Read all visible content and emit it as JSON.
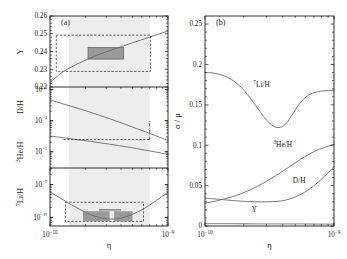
{
  "figure": {
    "caption_tags": {
      "left": "(a)",
      "right": "(b)"
    }
  },
  "panel_a": {
    "tag": "(a)",
    "xlabel": "η",
    "xticklabels": [
      "10⁻¹⁰",
      "10⁻⁹"
    ],
    "xlim": [
      1e-10,
      1e-09
    ],
    "shaded_band": [
      1.45e-10,
      7e-10
    ],
    "subpanels": [
      {
        "name": "Y",
        "ylabel": "Y",
        "ylim": [
          0.22,
          0.26
        ],
        "yticklabels": [
          "0.22",
          "0.23",
          "0.24",
          "0.25",
          "0.26"
        ],
        "ytickvalues": [
          0.22,
          0.23,
          0.24,
          0.25,
          0.26
        ],
        "curve": {
          "x": [
            1e-10,
            1.3e-10,
            1.8e-10,
            2.5e-10,
            3.5e-10,
            5e-10,
            7e-10,
            1e-09
          ],
          "y": [
            0.2225,
            0.2287,
            0.2337,
            0.2379,
            0.2414,
            0.2449,
            0.2481,
            0.2516
          ]
        },
        "dashed_box": {
          "x0": 1.13e-10,
          "x1": 7.1e-10,
          "y0": 0.2288,
          "y1": 0.2492
        },
        "filled_box": {
          "x0": 2.1e-10,
          "x1": 4.2e-10,
          "y0": 0.2357,
          "y1": 0.2422
        }
      },
      {
        "name": "D/H and 3He/H",
        "ylabel_upper": "D/H",
        "ylabel_lower": "³He/H",
        "ylim": [
          3e-06,
          0.0012
        ],
        "yticklabels": [
          "10⁻³",
          "10⁻⁴",
          "10⁻⁵"
        ],
        "ytickvalues": [
          0.001,
          0.0001,
          1e-05
        ],
        "curve_DH": {
          "x": [
            1e-10,
            1.5e-10,
            2.2e-10,
            3.2e-10,
            4.5e-10,
            6.5e-10,
            1e-09
          ],
          "y": [
            0.00046,
            0.00029,
            0.000185,
            0.000115,
            7.2e-05,
            4.3e-05,
            2.3e-05
          ]
        },
        "curve_He3H": {
          "x": [
            1e-10,
            1.5e-10,
            2.2e-10,
            3.2e-10,
            4.5e-10,
            6.5e-10,
            1e-09
          ],
          "y": [
            3.2e-05,
            2.6e-05,
            2.15e-05,
            1.75e-05,
            1.42e-05,
            1.12e-05,
            8.2e-06
          ]
        },
        "dashed_line_y": 2.45e-05,
        "dashed_line_x": [
          1.3e-10,
          7e-10
        ],
        "dashdot_vline_x": 7e-10,
        "dashdot_vline_y": [
          2.45e-05,
          9.5e-05
        ]
      },
      {
        "name": "7Li/H",
        "ylabel": "⁷Li/H",
        "ylim": [
          5.5e-11,
          3.2e-09
        ],
        "yticklabels": [
          "10⁻⁹",
          "10⁻¹⁰"
        ],
        "ytickvalues": [
          1e-09,
          1e-10
        ],
        "curve": {
          "x": [
            1e-10,
            1.3e-10,
            1.7e-10,
            2.2e-10,
            2.9e-10,
            3.6e-10,
            4.4e-10,
            5.5e-10,
            7e-10,
            1e-09
          ],
          "y": [
            6e-10,
            3.4e-10,
            1.95e-10,
            1.22e-10,
            9.3e-11,
            9.1e-11,
            1.05e-10,
            1.45e-10,
            2.4e-10,
            5.8e-10
          ]
        },
        "dashed_box": {
          "x0": 1.35e-10,
          "x1": 6.2e-10,
          "y0": 7.6e-11,
          "y1": 2.9e-10
        },
        "filled_left": {
          "x0": 1.9e-10,
          "x1": 3.2e-10,
          "y0": 7.6e-11,
          "y1": 1.55e-10
        },
        "filled_right": {
          "x0": 3.5e-10,
          "x1": 5e-10,
          "y0": 7.6e-11,
          "y1": 1.55e-10
        }
      }
    ]
  },
  "panel_b": {
    "tag": "(b)",
    "xlabel": "η",
    "ylabel": "σ / μ",
    "xticklabels": [
      "10⁻¹⁰",
      "10⁻⁹"
    ],
    "xlim": [
      1e-10,
      1e-09
    ],
    "ylim": [
      0,
      0.26
    ],
    "yticklabels": [
      "0",
      "0.05",
      "0.1",
      "0.15",
      "0.2",
      "0.25"
    ],
    "ytickvalues": [
      0,
      0.05,
      0.1,
      0.15,
      0.2,
      0.25
    ],
    "series": [
      {
        "label": "⁷Li/H",
        "label_x": 2.3e-10,
        "label_y": 0.172,
        "x": [
          1e-10,
          1.2e-10,
          1.5e-10,
          1.9e-10,
          2.4e-10,
          3e-10,
          3.6e-10,
          4.2e-10,
          4.8e-10,
          5.5e-10,
          6.5e-10,
          8e-10,
          1e-09
        ],
        "y": [
          0.19,
          0.189,
          0.184,
          0.172,
          0.152,
          0.131,
          0.122,
          0.126,
          0.139,
          0.153,
          0.163,
          0.167,
          0.168
        ]
      },
      {
        "label": "³He/H",
        "label_x": 3.6e-10,
        "label_y": 0.098,
        "x": [
          1e-10,
          1.3e-10,
          1.8e-10,
          2.4e-10,
          3.2e-10,
          4.2e-10,
          5.5e-10,
          7e-10,
          8.5e-10,
          1e-09
        ],
        "y": [
          0.0282,
          0.032,
          0.0385,
          0.047,
          0.058,
          0.07,
          0.0825,
          0.092,
          0.0975,
          0.101
        ]
      },
      {
        "label": "D/H",
        "label_x": 5e-10,
        "label_y": 0.0535,
        "x": [
          1e-10,
          1.3e-10,
          1.8e-10,
          2.4e-10,
          3.2e-10,
          4.2e-10,
          5.5e-10,
          7e-10,
          8.5e-10,
          1e-09
        ],
        "y": [
          0.0345,
          0.033,
          0.031,
          0.03,
          0.03,
          0.032,
          0.039,
          0.05,
          0.062,
          0.0735
        ]
      },
      {
        "label": "Y",
        "label_x": 2.4e-10,
        "label_y": 0.0175,
        "x": [
          1e-10,
          2e-10,
          4e-10,
          6e-10,
          8e-10,
          1e-09
        ],
        "y": [
          0.003,
          0.0028,
          0.0026,
          0.0025,
          0.0024,
          0.0023
        ]
      }
    ]
  },
  "chart_data": {
    "type": "line",
    "title": "",
    "xlabel": "η",
    "panels": [
      {
        "id": "a",
        "description": "Primordial abundances vs baryon-to-photon ratio",
        "subplots": [
          {
            "ylabel": "Y",
            "ylim": [
              0.22,
              0.26
            ],
            "yscale": "linear",
            "yticks": [
              0.22,
              0.23,
              0.24,
              0.25,
              0.26
            ],
            "series": [
              {
                "name": "Y",
                "x": [
                  1e-10,
                  1.3e-10,
                  1.8e-10,
                  2.5e-10,
                  3.5e-10,
                  5e-10,
                  7e-10,
                  1e-09
                ],
                "y": [
                  0.2225,
                  0.2287,
                  0.2337,
                  0.2379,
                  0.2414,
                  0.2449,
                  0.2481,
                  0.2516
                ]
              }
            ]
          },
          {
            "ylabel": "D/H , ³He/H",
            "ylim": [
              3e-06,
              0.0012
            ],
            "yscale": "log",
            "yticks": [
              0.001,
              0.0001,
              1e-05
            ],
            "series": [
              {
                "name": "D/H",
                "x": [
                  1e-10,
                  1.5e-10,
                  2.2e-10,
                  3.2e-10,
                  4.5e-10,
                  6.5e-10,
                  1e-09
                ],
                "y": [
                  0.00046,
                  0.00029,
                  0.000185,
                  0.000115,
                  7.2e-05,
                  4.3e-05,
                  2.3e-05
                ]
              },
              {
                "name": "³He/H",
                "x": [
                  1e-10,
                  1.5e-10,
                  2.2e-10,
                  3.2e-10,
                  4.5e-10,
                  6.5e-10,
                  1e-09
                ],
                "y": [
                  3.2e-05,
                  2.6e-05,
                  2.15e-05,
                  1.75e-05,
                  1.42e-05,
                  1.12e-05,
                  8.2e-06
                ]
              }
            ]
          },
          {
            "ylabel": "⁷Li/H",
            "ylim": [
              5.5e-11,
              3.2e-09
            ],
            "yscale": "log",
            "yticks": [
              1e-09,
              1e-10
            ],
            "series": [
              {
                "name": "⁷Li/H",
                "x": [
                  1e-10,
                  1.3e-10,
                  1.7e-10,
                  2.2e-10,
                  2.9e-10,
                  3.6e-10,
                  4.4e-10,
                  5.5e-10,
                  7e-10,
                  1e-09
                ],
                "y": [
                  6e-10,
                  3.4e-10,
                  1.95e-10,
                  1.22e-10,
                  9.3e-11,
                  9.1e-11,
                  1.05e-10,
                  1.45e-10,
                  2.4e-10,
                  5.8e-10
                ]
              }
            ]
          }
        ]
      },
      {
        "id": "b",
        "description": "Relative uncertainty sigma/mu vs eta",
        "ylabel": "σ / μ",
        "ylim": [
          0,
          0.26
        ],
        "yscale": "linear",
        "yticks": [
          0,
          0.05,
          0.1,
          0.15,
          0.2,
          0.25
        ],
        "series": [
          {
            "name": "⁷Li/H",
            "x": [
              1e-10,
              1.5e-10,
              2.4e-10,
              3.6e-10,
              4.8e-10,
              6.5e-10,
              1e-09
            ],
            "y": [
              0.19,
              0.184,
              0.152,
              0.122,
              0.139,
              0.163,
              0.168
            ]
          },
          {
            "name": "³He/H",
            "x": [
              1e-10,
              1.8e-10,
              3.2e-10,
              5.5e-10,
              8.5e-10,
              1e-09
            ],
            "y": [
              0.0282,
              0.0385,
              0.058,
              0.0825,
              0.0975,
              0.101
            ]
          },
          {
            "name": "D/H",
            "x": [
              1e-10,
              1.8e-10,
              3.2e-10,
              5.5e-10,
              8.5e-10,
              1e-09
            ],
            "y": [
              0.0345,
              0.031,
              0.03,
              0.039,
              0.062,
              0.0735
            ]
          },
          {
            "name": "Y",
            "x": [
              1e-10,
              4e-10,
              1e-09
            ],
            "y": [
              0.003,
              0.0026,
              0.0023
            ]
          }
        ]
      }
    ]
  },
  "colors": {
    "axis": "#1a1a1a",
    "curve": "#6b6b6b",
    "band": "#ededed",
    "box_fill": "#9a9a9a",
    "dashed": "#2a2a2a"
  }
}
